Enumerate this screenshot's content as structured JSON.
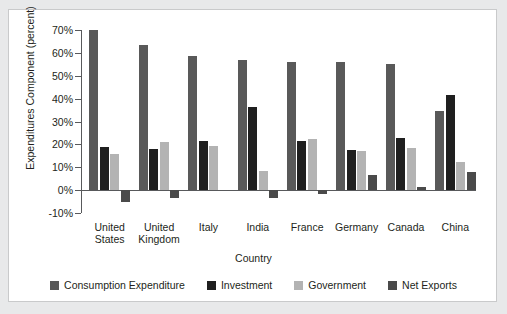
{
  "chart_data": {
    "type": "bar",
    "title": "",
    "xlabel": "Country",
    "ylabel": "Expenditures Component (percent)",
    "ylim": [
      -10,
      70
    ],
    "ytick_values": [
      70,
      60,
      50,
      40,
      30,
      20,
      10,
      0,
      -10
    ],
    "ytick_labels": [
      "70%",
      "60%",
      "50%",
      "40%",
      "30%",
      "20%",
      "10%",
      "0%",
      "-10%"
    ],
    "grid": false,
    "legend_position": "bottom",
    "categories": [
      "United States",
      "United Kingdom",
      "Italy",
      "India",
      "France",
      "Germany",
      "Canada",
      "China"
    ],
    "category_label_lines": [
      [
        "United",
        "States"
      ],
      [
        "United",
        "Kingdom"
      ],
      [
        "Italy",
        ""
      ],
      [
        "India",
        ""
      ],
      [
        "France",
        ""
      ],
      [
        "Germany",
        ""
      ],
      [
        "Canada",
        ""
      ],
      [
        "China",
        ""
      ]
    ],
    "series": [
      {
        "name": "Consumption Expenditure",
        "color": "#595959",
        "values": [
          70.0,
          63.5,
          58.5,
          57.0,
          56.0,
          56.0,
          55.0,
          34.5
        ]
      },
      {
        "name": "Investment",
        "color": "#1f1f1f",
        "values": [
          19.0,
          18.0,
          21.5,
          36.5,
          21.5,
          17.5,
          23.0,
          41.5
        ]
      },
      {
        "name": "Government",
        "color": "#b3b3b3",
        "values": [
          15.8,
          21.0,
          19.3,
          8.5,
          22.5,
          17.3,
          18.5,
          12.5
        ]
      },
      {
        "name": "Net Exports",
        "color": "#4a4a4a",
        "values": [
          -5.0,
          -3.5,
          0.0,
          -3.5,
          -1.5,
          6.5,
          1.3,
          8.0
        ]
      }
    ]
  },
  "legend": {
    "items": [
      {
        "label": "Consumption Expenditure",
        "color": "#595959"
      },
      {
        "label": "Investment",
        "color": "#1f1f1f"
      },
      {
        "label": "Government",
        "color": "#b3b3b3"
      },
      {
        "label": "Net Exports",
        "color": "#4a4a4a"
      }
    ]
  }
}
